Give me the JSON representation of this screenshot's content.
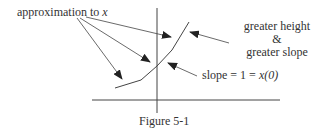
{
  "figure": {
    "caption": "Figure 5-1",
    "labels": {
      "approximation": "approximation to",
      "approximation_var": "x",
      "greater_height": "greater height",
      "ampersand": "&",
      "greater_slope": "greater slope",
      "slope_prefix": "slope = 1 = ",
      "slope_expr": "x(0)"
    },
    "axes": {
      "horizontal": true,
      "vertical": true
    },
    "curve": {
      "description": "piecewise-linear approximation with increasing slope",
      "points": [
        [
          115,
          88
        ],
        [
          141,
          80
        ],
        [
          157,
          66
        ],
        [
          172,
          50
        ],
        [
          189,
          22
        ]
      ]
    }
  }
}
